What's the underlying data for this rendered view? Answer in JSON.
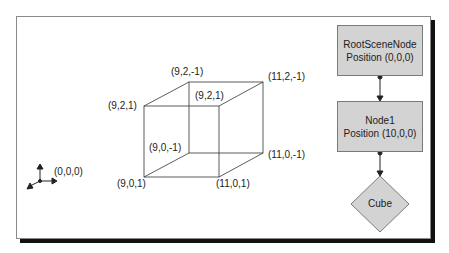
{
  "diagram": {
    "colors": {
      "frame_shadow": "#111111",
      "node_fill": "#d3d3d3",
      "node_border": "#7a7a7a",
      "line": "#333333"
    },
    "origin": {
      "label": "(0,0,0)"
    },
    "cube": {
      "vertices": {
        "front_top_left": "(9,2,1)",
        "back_top_left": "(9,2,-1)",
        "back_top_right": "(11,2,-1)",
        "front_top_right": "(9,2,1)",
        "back_bottom_left": "(9,0,-1)",
        "back_bottom_right": "(11,0,-1)",
        "front_bottom_left": "(9,0,1)",
        "front_bottom_right": "(11,0,1)"
      }
    },
    "scene_graph": {
      "nodes": [
        {
          "name": "RootSceneNode",
          "position": "Position (0,0,0)"
        },
        {
          "name": "Node1",
          "position": "Position (10,0,0)"
        }
      ],
      "entity": {
        "name": "Cube"
      }
    }
  }
}
